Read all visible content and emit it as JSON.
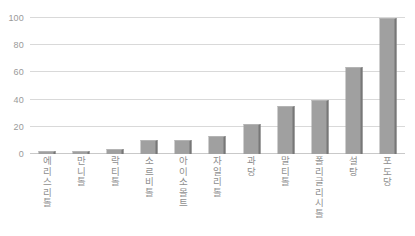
{
  "chart_data": {
    "type": "bar",
    "title": "",
    "xlabel": "",
    "ylabel": "",
    "ylim": [
      0,
      100
    ],
    "yticks": [
      0,
      20,
      40,
      60,
      80,
      100
    ],
    "grid": true,
    "legend": "none",
    "bar_color": "#a0a0a0",
    "bar_shadow_color": "#777777",
    "gridline_color": "#d9d9d9",
    "tick_label_color": "#9a9a9a",
    "categories": [
      "에리스리톨",
      "만니톨",
      "락티톨",
      "소르비톨",
      "아이소몰트",
      "자일리톨",
      "과당",
      "말티톨",
      "폴리글리시톨",
      "설탕",
      "포도당"
    ],
    "values": [
      2,
      2,
      4,
      10,
      10,
      13,
      22,
      35,
      40,
      64,
      100
    ]
  }
}
